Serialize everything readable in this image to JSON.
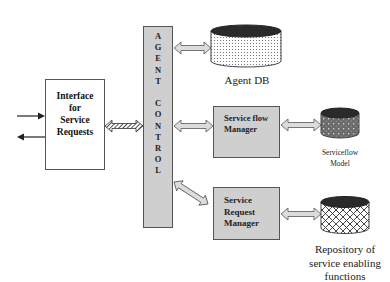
{
  "diagram": {
    "interface": {
      "lines": [
        "Interface",
        "for",
        "Service",
        "Requests"
      ]
    },
    "agent_control": {
      "letters": [
        "A",
        "G",
        "E",
        "N",
        "T",
        "",
        "C",
        "O",
        "N",
        "T",
        "R",
        "O",
        "L"
      ]
    },
    "agent_db": {
      "label": "Agent DB"
    },
    "service_flow_manager": {
      "lines": [
        "Service flow",
        "Manager"
      ]
    },
    "serviceflow_model": {
      "lines": [
        "Serviceflow",
        "Model"
      ]
    },
    "service_request_manager": {
      "lines": [
        "Service",
        "Request",
        "Manager"
      ]
    },
    "repository": {
      "lines": [
        "Repository of",
        "service enabling",
        "functions"
      ]
    },
    "colors": {
      "box_fill": "#cfcfcf",
      "border": "#555555",
      "cylinder_top": "#2a2a2a"
    }
  }
}
